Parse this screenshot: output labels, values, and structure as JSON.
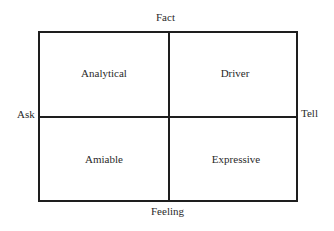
{
  "diagram": {
    "axes": {
      "top": "Fact",
      "bottom": "Feeling",
      "left": "Ask",
      "right": "Tell"
    },
    "quadrants": {
      "top_left": "Analytical",
      "top_right": "Driver",
      "bottom_left": "Amiable",
      "bottom_right": "Expressive"
    },
    "colors": {
      "line": "#1e1e1e",
      "text": "#2a2a2a",
      "background": "#ffffff"
    }
  }
}
